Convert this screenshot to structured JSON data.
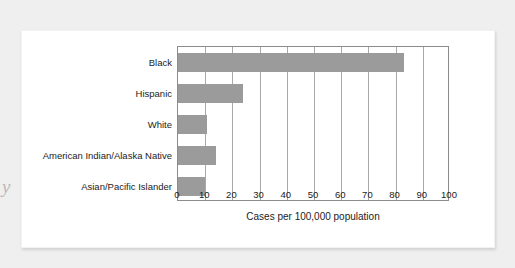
{
  "chart_data": {
    "type": "bar",
    "orientation": "horizontal",
    "title": "",
    "subtitle": "",
    "xlabel": "Cases per 100,000 population",
    "ylabel": "",
    "categories": [
      "Black",
      "Hispanic",
      "White",
      "American Indian/Alaska Native",
      "Asian/Pacific Islander"
    ],
    "values": [
      83,
      24,
      10.5,
      14,
      10
    ],
    "series": [
      {
        "name": "Cases per 100,000 population",
        "values": [
          83,
          24,
          10.5,
          14,
          10
        ]
      }
    ],
    "xlim": [
      0,
      100
    ],
    "xticks": [
      0,
      10,
      20,
      30,
      40,
      50,
      60,
      70,
      80,
      90,
      100
    ],
    "xtick_labels": [
      "0",
      "10",
      "20",
      "30",
      "40",
      "50",
      "60",
      "70",
      "80",
      "90",
      "100"
    ],
    "grid": "vertical",
    "legend": "none",
    "bar_color": "#9b9b9b",
    "axis_color": "#8c8c8c",
    "gridline_color": "#a9a9a9",
    "background": "#ffffff"
  },
  "page": {
    "background_color": "#efefef",
    "card_background": "#ffffff",
    "bleed_glyph": "y",
    "bleed_glyph_2": "A"
  }
}
